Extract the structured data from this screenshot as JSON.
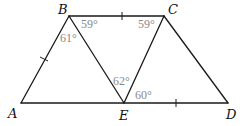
{
  "diagram": {
    "type": "geometry",
    "vertices": [
      {
        "id": "A",
        "label": "A",
        "x": 21,
        "y": 103,
        "lx": 8,
        "ly": 118
      },
      {
        "id": "B",
        "label": "B",
        "x": 69,
        "y": 16,
        "lx": 58,
        "ly": 14
      },
      {
        "id": "C",
        "label": "C",
        "x": 164,
        "y": 16,
        "lx": 168,
        "ly": 14
      },
      {
        "id": "E",
        "label": "E",
        "x": 124,
        "y": 103,
        "lx": 119,
        "ly": 120
      },
      {
        "id": "D",
        "label": "D",
        "x": 228,
        "y": 103,
        "lx": 226,
        "ly": 119
      }
    ],
    "segments": [
      {
        "from": "A",
        "to": "B"
      },
      {
        "from": "B",
        "to": "C"
      },
      {
        "from": "C",
        "to": "D"
      },
      {
        "from": "A",
        "to": "D"
      },
      {
        "from": "B",
        "to": "E"
      },
      {
        "from": "C",
        "to": "E"
      }
    ],
    "tick_marks": [
      {
        "segment": "AB",
        "x": 44,
        "y": 59
      },
      {
        "segment": "BC",
        "x": 122,
        "y": 16
      },
      {
        "segment": "ED",
        "x": 176,
        "y": 103
      }
    ],
    "angles": [
      {
        "vertex": "B",
        "between": "CBE",
        "label": "59°",
        "x": 82,
        "y": 28
      },
      {
        "vertex": "B",
        "between": "ABE",
        "label": "61°",
        "x": 60,
        "y": 42
      },
      {
        "vertex": "C",
        "between": "BCE",
        "label": "59°",
        "x": 139,
        "y": 28
      },
      {
        "vertex": "E",
        "between": "BEC",
        "label": "62°",
        "x": 115,
        "y": 84
      },
      {
        "vertex": "E",
        "between": "CED",
        "label": "60°",
        "x": 135,
        "y": 99
      }
    ]
  },
  "labels": {
    "A": "A",
    "B": "B",
    "C": "C",
    "D": "D",
    "E": "E",
    "angle_B_upper": "59°",
    "angle_B_lower": "61°",
    "angle_C": "59°",
    "angle_E_upper": "62°",
    "angle_E_right": "60°"
  },
  "colors": {
    "line": "#1a1a1a",
    "vertex_label": "#111111",
    "angle_label": "#8a8a8a",
    "background": "#ffffff"
  }
}
